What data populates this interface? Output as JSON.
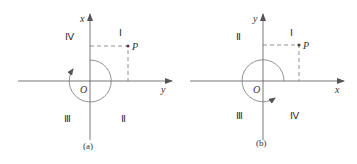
{
  "colors": {
    "axis": "#555555",
    "circle": "#777777",
    "dash": "#777777",
    "text": "#333333",
    "point": "#444444"
  },
  "panels": [
    {
      "id": "a",
      "caption": "(a)",
      "vertical_axis_label": "x",
      "horizontal_axis_label": "y",
      "origin_label": "O",
      "point_label": "P",
      "quadrants": {
        "upper_left": "Ⅳ",
        "upper_right": "Ⅰ",
        "lower_left": "Ⅲ",
        "lower_right": "Ⅱ"
      },
      "rotation": "clockwise"
    },
    {
      "id": "b",
      "caption": "(b)",
      "vertical_axis_label": "y",
      "horizontal_axis_label": "x",
      "origin_label": "O",
      "point_label": "P",
      "quadrants": {
        "upper_left": "Ⅱ",
        "upper_right": "Ⅰ",
        "lower_left": "Ⅲ",
        "lower_right": "Ⅳ"
      },
      "rotation": "counterclockwise"
    }
  ]
}
